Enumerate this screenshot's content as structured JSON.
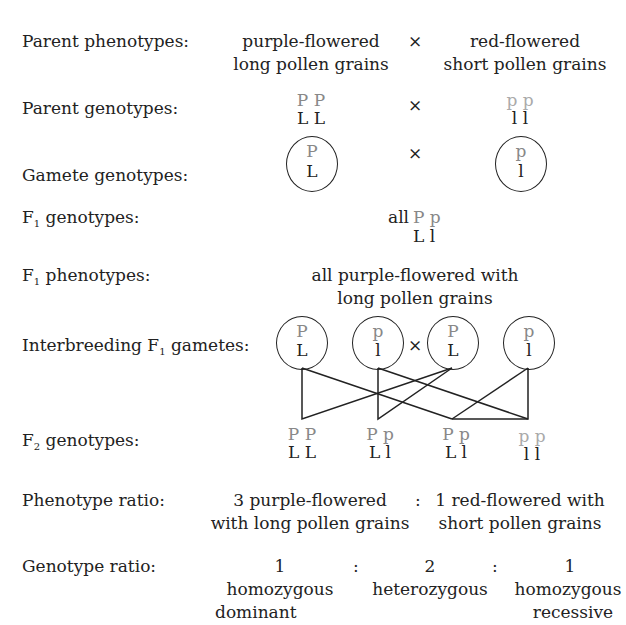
{
  "top_partial": "...typ... ...2 g...",
  "rows": {
    "parent_phenotypes": {
      "label": "Parent phenotypes:",
      "left": [
        "purple-flowered",
        "long pollen grains"
      ],
      "cross": "×",
      "right": [
        "red-flowered",
        "short pollen grains"
      ]
    },
    "parent_genotypes": {
      "label": "Parent genotypes:",
      "left": [
        "P P",
        "L L"
      ],
      "cross": "×",
      "right": [
        "p p",
        "l  l"
      ]
    },
    "gamete_genotypes": {
      "label": "Gamete genotypes:",
      "left": [
        "P",
        "L"
      ],
      "cross": "×",
      "right": [
        "p",
        "l"
      ]
    },
    "f1_genotypes": {
      "label_pre": "F",
      "label_sub": "1",
      "label_post": " genotypes:",
      "prefix": "all",
      "line1": "P p",
      "line2": "L l"
    },
    "f1_phenotypes": {
      "label_pre": "F",
      "label_sub": "1",
      "label_post": " phenotypes:",
      "lines": [
        "all purple-flowered with",
        "long pollen grains"
      ]
    },
    "interbreeding": {
      "label_pre": "Interbreeding F",
      "label_sub": "1",
      "label_post": " gametes:",
      "gametes": [
        [
          "P",
          "L"
        ],
        [
          "p",
          "l"
        ],
        [
          "P",
          "L"
        ],
        [
          "p",
          "l"
        ]
      ],
      "cross": "×"
    },
    "f2_genotypes": {
      "label_pre": "F",
      "label_sub": "2",
      "label_post": " genotypes:",
      "items": [
        [
          "P P",
          "L L"
        ],
        [
          "P p",
          "L l"
        ],
        [
          "P p",
          "L l"
        ],
        [
          "p p",
          "l  l"
        ]
      ]
    },
    "phenotype_ratio": {
      "label": "Phenotype ratio:",
      "left": [
        "3 purple-flowered",
        "with long pollen grains"
      ],
      "sep": ":",
      "right": [
        "1 red-flowered with",
        "short pollen grains"
      ]
    },
    "genotype_ratio": {
      "label": "Genotype ratio:",
      "sep": ":",
      "cols": [
        {
          "num": "1",
          "desc": [
            "homozygous",
            "dominant"
          ]
        },
        {
          "num": "2",
          "desc": [
            "heterozygous"
          ]
        },
        {
          "num": "1",
          "desc": [
            "homozygous",
            "recessive"
          ]
        }
      ]
    }
  }
}
